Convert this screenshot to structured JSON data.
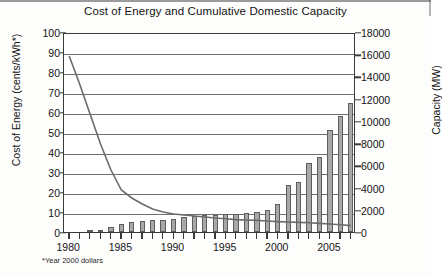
{
  "chart_data": {
    "type": "bar",
    "title": "Cost of Energy and Cumulative Domestic Capacity",
    "footnote": "*Year 2000 dollars",
    "xlabel": "",
    "ylabel": "Cost of Energy (cents/kWh*)",
    "y2label": "Capacity (MW)",
    "ylim": [
      0,
      100
    ],
    "y2lim": [
      0,
      18000
    ],
    "ytick_labels": [
      "0",
      "10",
      "20",
      "30",
      "40",
      "50",
      "60",
      "70",
      "80",
      "90",
      "100"
    ],
    "ytick_values": [
      0,
      10,
      20,
      30,
      40,
      50,
      60,
      70,
      80,
      90,
      100
    ],
    "y2tick_labels": [
      "0",
      "2000",
      "4000",
      "6000",
      "8000",
      "10000",
      "12000",
      "14000",
      "16000",
      "18000"
    ],
    "y2tick_values": [
      0,
      2000,
      4000,
      6000,
      8000,
      10000,
      12000,
      14000,
      16000,
      18000
    ],
    "grid": "horizontal",
    "legend": "none",
    "x": [
      1980,
      1981,
      1982,
      1983,
      1984,
      1985,
      1986,
      1987,
      1988,
      1989,
      1990,
      1991,
      1992,
      1993,
      1994,
      1995,
      1996,
      1997,
      1998,
      1999,
      2000,
      2001,
      2002,
      2003,
      2004,
      2005,
      2006,
      2007
    ],
    "xtick_labels": [
      "1980",
      "1985",
      "1990",
      "1995",
      "2000",
      "2005"
    ],
    "xtick_values": [
      1980,
      1985,
      1990,
      1995,
      2000,
      2005
    ],
    "series": [
      {
        "name": "Cumulative Domestic Capacity",
        "type": "bar",
        "axis": "right",
        "unit": "MW",
        "values": [
          0,
          0,
          60,
          180,
          450,
          700,
          900,
          1000,
          1050,
          1100,
          1200,
          1350,
          1450,
          1500,
          1550,
          1600,
          1650,
          1700,
          1800,
          1950,
          2550,
          4200,
          4500,
          6250,
          6750,
          9150,
          10400,
          11600
        ]
      },
      {
        "name": "Cost of Energy",
        "type": "line",
        "axis": "left",
        "unit": "cents/kWh",
        "values": [
          89,
          75,
          60,
          45,
          32,
          22,
          18,
          15,
          12.5,
          11,
          10,
          9.5,
          9,
          8.5,
          8,
          7.6,
          7.2,
          7,
          6.8,
          6.5,
          6.2,
          6,
          5.8,
          5.6,
          5.3,
          5,
          4.6,
          4.2
        ]
      }
    ]
  }
}
